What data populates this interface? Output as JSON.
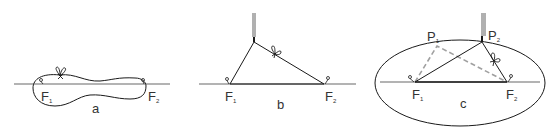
{
  "figure": {
    "colors": {
      "baseline": "#9a9a9a",
      "string": "#1a1a1a",
      "dashed": "#a0a0a0",
      "pencil": "#b0b0b0",
      "text": "#333333"
    },
    "panels": [
      {
        "id": "a",
        "caption": "a",
        "foci": [
          {
            "label": "F",
            "sub": "1"
          },
          {
            "label": "F",
            "sub": "2"
          }
        ],
        "description": "Closed loop of string around two pins with a knot"
      },
      {
        "id": "b",
        "caption": "b",
        "foci": [
          {
            "label": "F",
            "sub": "1"
          },
          {
            "label": "F",
            "sub": "2"
          }
        ],
        "description": "Pencil pulls string taut into a triangle with the foci"
      },
      {
        "id": "c",
        "caption": "c",
        "foci": [
          {
            "label": "F",
            "sub": "1"
          },
          {
            "label": "F",
            "sub": "2"
          }
        ],
        "points": [
          {
            "label": "P",
            "sub": "1"
          },
          {
            "label": "P",
            "sub": "2"
          }
        ],
        "description": "Ellipse traced by pencil; dashed triangle at P1, solid at P2"
      }
    ]
  }
}
